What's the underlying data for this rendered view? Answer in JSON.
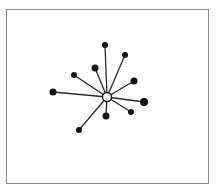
{
  "diagram": {
    "type": "star-network",
    "frame": {
      "x": 6,
      "y": 9,
      "width": 203,
      "height": 175,
      "color": "#8a8a8a"
    },
    "edge_color": "#2a2a2a",
    "node_color": "#111111",
    "hub": {
      "id": "hub",
      "x": 107,
      "y": 97,
      "r": 4.5,
      "fill": "#ffffff",
      "stroke": "#111111"
    },
    "nodes": [
      {
        "id": "n-top",
        "x": 105,
        "y": 45,
        "r": 3
      },
      {
        "id": "n-top-right",
        "x": 125,
        "y": 55,
        "r": 3
      },
      {
        "id": "n-inner-upper",
        "x": 95,
        "y": 68,
        "r": 3.5
      },
      {
        "id": "n-left-upper",
        "x": 74,
        "y": 75,
        "r": 3
      },
      {
        "id": "n-right-upper",
        "x": 134,
        "y": 81,
        "r": 3.5
      },
      {
        "id": "n-left",
        "x": 53,
        "y": 92,
        "r": 3.5
      },
      {
        "id": "n-right",
        "x": 144,
        "y": 102,
        "r": 4
      },
      {
        "id": "n-lower-right",
        "x": 131,
        "y": 112,
        "r": 3
      },
      {
        "id": "n-bottom",
        "x": 106,
        "y": 116,
        "r": 3.5
      },
      {
        "id": "n-lower-left",
        "x": 79,
        "y": 130,
        "r": 3
      }
    ]
  }
}
